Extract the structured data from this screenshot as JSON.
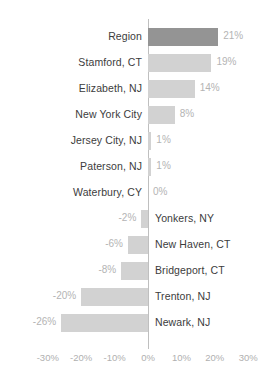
{
  "chart_data": {
    "type": "bar",
    "orientation": "horizontal",
    "title": "",
    "subtitle": "",
    "xlabel": "",
    "ylabel": "",
    "xlim": [
      -30,
      30
    ],
    "xticks": [
      -30,
      -20,
      -10,
      0,
      10,
      20,
      30
    ],
    "xtick_labels": [
      "-30%",
      "-20%",
      "-10%",
      "0%",
      "10%",
      "20%",
      "30%"
    ],
    "grid": false,
    "legend": null,
    "zero_line": true,
    "value_suffix": "%",
    "categories": [
      "Region",
      "Stamford, CT",
      "Elizabeth, NJ",
      "New York City",
      "Jersey City, NJ",
      "Paterson, NJ",
      "Waterbury, CY",
      "Yonkers, NY",
      "New Haven, CT",
      "Bridgeport, CT",
      "Trenton, NJ",
      "Newark, NJ"
    ],
    "values": [
      21,
      19,
      14,
      8,
      1,
      1,
      0,
      -2,
      -6,
      -8,
      -20,
      -26
    ],
    "value_labels": [
      "21%",
      "19%",
      "14%",
      "8%",
      "1%",
      "1%",
      "0%",
      "-2%",
      "-6%",
      "-8%",
      "-20%",
      "-26%"
    ],
    "highlight_index": 0,
    "colors": {
      "bar_default": "#d2d2d2",
      "bar_highlight": "#949494",
      "category_label": "#3c3c3c",
      "value_label": "#b4b4b4",
      "axis_label": "#b0b0b0",
      "zero_line": "#bfbfbf",
      "background": "#ffffff"
    }
  }
}
